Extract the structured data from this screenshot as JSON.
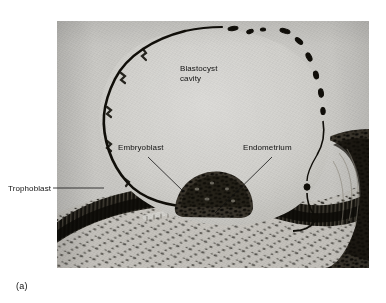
{
  "figure": {
    "caption": "(a)",
    "plate": {
      "background_color": "#cdcdcb",
      "tissue_dark_color": "#15140f",
      "cavity_color": "#d4d3d0"
    },
    "labels": [
      {
        "id": "blastocyst-cavity",
        "lines": [
          "Blastocyst",
          "cavity"
        ],
        "text": "Blastocyst\ncavity",
        "has_leader_line": false
      },
      {
        "id": "embryoblast",
        "text": "Embryoblast",
        "has_leader_line": true
      },
      {
        "id": "endometrium",
        "text": "Endometrium",
        "has_leader_line": true
      },
      {
        "id": "trophoblast",
        "text": "Trophoblast",
        "has_leader_line": true
      }
    ]
  }
}
